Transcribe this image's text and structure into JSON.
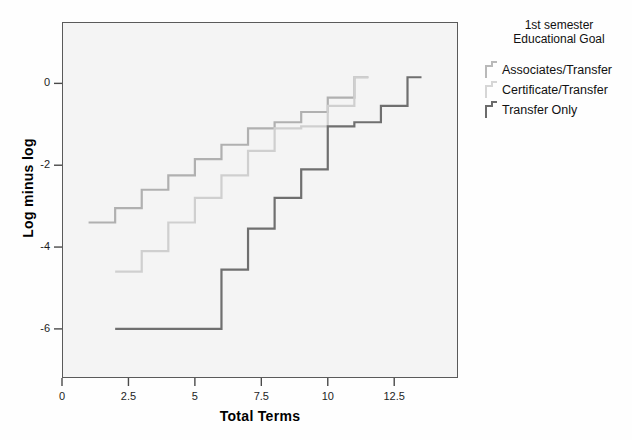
{
  "chart_data": {
    "type": "line",
    "title": "",
    "xlabel": "Total Terms",
    "ylabel": "Log minus log",
    "xlim": [
      0,
      14.9
    ],
    "ylim": [
      -7.2,
      1.5
    ],
    "xticks": [
      "0",
      "2.5",
      "5",
      "7.5",
      "10",
      "12.5"
    ],
    "xtick_values": [
      0,
      2.5,
      5,
      7.5,
      10,
      12.5
    ],
    "yticks": [
      "0",
      "-2",
      "-4",
      "-6"
    ],
    "ytick_values": [
      0,
      -2,
      -4,
      -6
    ],
    "grid": false,
    "step_style": "post",
    "legend": {
      "position": "right",
      "title": "1st semester\nEducational Goal",
      "entries": [
        {
          "name": "Associates/Transfer",
          "color": "#b9b9b9"
        },
        {
          "name": "Certificate/Transfer",
          "color": "#d6d6d6"
        },
        {
          "name": "Transfer Only",
          "color": "#6b6b6b"
        }
      ]
    },
    "series": [
      {
        "name": "Associates/Transfer",
        "color": "#b0b0b0",
        "x": [
          1,
          2,
          3,
          4,
          5,
          6,
          7,
          8,
          9,
          10,
          11
        ],
        "y": [
          -3.4,
          -3.05,
          -2.6,
          -2.25,
          -1.85,
          -1.5,
          -1.1,
          -0.95,
          -0.7,
          -0.35,
          0.15
        ]
      },
      {
        "name": "Certificate/Transfer",
        "color": "#cfcfcf",
        "x": [
          2,
          3,
          4,
          5,
          6,
          7,
          8,
          9,
          10,
          11
        ],
        "y": [
          -4.6,
          -4.1,
          -3.4,
          -2.8,
          -2.25,
          -1.65,
          -1.1,
          -1.05,
          -0.55,
          0.15
        ]
      },
      {
        "name": "Transfer Only",
        "color": "#6f6f6f",
        "x": [
          2,
          5,
          6,
          7,
          8,
          9,
          10,
          11,
          12,
          13
        ],
        "y": [
          -6.0,
          -6.0,
          -4.55,
          -3.55,
          -2.8,
          -2.1,
          -1.05,
          -0.95,
          -0.55,
          0.15
        ]
      }
    ]
  },
  "axes": {
    "x_title": "Total Terms",
    "y_title": "Log minus log"
  }
}
